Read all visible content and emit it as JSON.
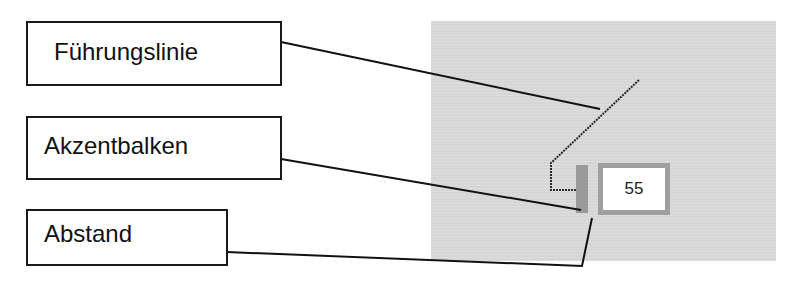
{
  "callouts": [
    {
      "id": "fuehrungslinie",
      "label": "Führungslinie"
    },
    {
      "id": "akzentbalken",
      "label": "Akzentbalken"
    },
    {
      "id": "abstand",
      "label": "Abstand"
    }
  ],
  "preview": {
    "data_label_value": "55",
    "colors": {
      "panel_background": "#d6d6d6",
      "accent_bar": "#9a9a9a",
      "label_border": "#9f9f9f",
      "leader_line": "#2a2a2a"
    }
  }
}
